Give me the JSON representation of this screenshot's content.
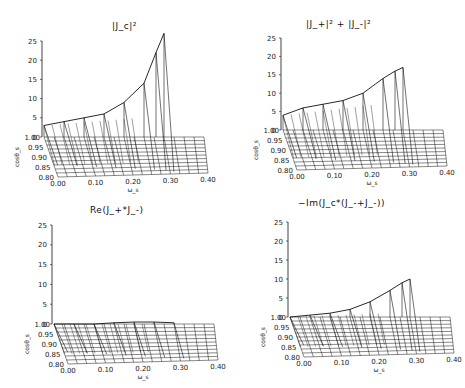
{
  "chart_data": [
    {
      "type": "surface3d",
      "title": "|J_c|²",
      "xlabel": "ω_s",
      "ylabel": "cosθ_s",
      "zlabel": "",
      "x_ticks": [
        "0.00",
        "0.10",
        "0.20",
        "0.30",
        "0.40"
      ],
      "y_ticks": [
        "0.80",
        "0.85",
        "0.90",
        "0.95",
        "1.00"
      ],
      "z_ticks": [
        "0",
        "5",
        "10",
        "15",
        "20",
        "25"
      ],
      "xlim": [
        0,
        0.4
      ],
      "ylim": [
        0.8,
        1.0
      ],
      "zlim": [
        0,
        25
      ],
      "x": [
        0.0,
        0.05,
        0.1,
        0.15,
        0.2,
        0.25,
        0.28,
        0.3
      ],
      "peak_at_cos1": [
        3,
        4,
        5,
        6,
        9,
        14,
        22,
        27
      ],
      "description": "Grows sharply with ω_s along cosθ_s=1 ridge, up to ~27 near ω_s≈0.30; near zero elsewhere"
    },
    {
      "type": "surface3d",
      "title": "|J_+|² + |J_-|²",
      "xlabel": "ω_s",
      "ylabel": "cosθ_s",
      "x_ticks": [
        "0.00",
        "0.10",
        "0.20",
        "0.30",
        "0.40"
      ],
      "y_ticks": [
        "0.80",
        "0.85",
        "0.90",
        "0.95",
        "1.00"
      ],
      "z_ticks": [
        "0",
        "5",
        "10",
        "15",
        "20",
        "25"
      ],
      "xlim": [
        0,
        0.4
      ],
      "ylim": [
        0.8,
        1.0
      ],
      "zlim": [
        0,
        25
      ],
      "x": [
        0.0,
        0.05,
        0.1,
        0.15,
        0.2,
        0.25,
        0.28,
        0.3
      ],
      "peak_at_cos1": [
        4,
        6,
        7,
        8,
        10,
        14,
        16,
        17
      ],
      "description": "Ridge at cosθ_s=1 rising to ~17 at ω_s≈0.30"
    },
    {
      "type": "surface3d",
      "title": "Re(J_+*J_-)",
      "xlabel": "ω_s",
      "ylabel": "cosθ_s",
      "x_ticks": [
        "0.00",
        "0.10",
        "0.20",
        "0.30",
        "0.40"
      ],
      "y_ticks": [
        "0.80",
        "0.85",
        "0.90",
        "0.95",
        "1.00"
      ],
      "z_ticks": [
        "0",
        "5",
        "10",
        "15",
        "20",
        "25"
      ],
      "xlim": [
        0,
        0.4
      ],
      "ylim": [
        0.8,
        1.0
      ],
      "zlim": [
        0,
        25
      ],
      "x": [
        0.0,
        0.05,
        0.1,
        0.15,
        0.2,
        0.25,
        0.3
      ],
      "peak_at_cos1": [
        0,
        0,
        0,
        0.3,
        0.5,
        0.5,
        0.3
      ],
      "description": "Nearly flat, small values near zero"
    },
    {
      "type": "surface3d",
      "title": "-Im(J_c*(J_-+J_-))",
      "xlabel": "ω_s",
      "ylabel": "cosθ_s",
      "x_ticks": [
        "0.00",
        "0.10",
        "0.20",
        "0.30",
        "0.40"
      ],
      "y_ticks": [
        "0.80",
        "0.85",
        "0.90",
        "0.95",
        "1.00"
      ],
      "z_ticks": [
        "0",
        "5",
        "10",
        "15",
        "20",
        "25"
      ],
      "xlim": [
        0,
        0.4
      ],
      "ylim": [
        0.8,
        1.0
      ],
      "zlim": [
        0,
        25
      ],
      "x": [
        0.0,
        0.05,
        0.1,
        0.15,
        0.2,
        0.25,
        0.28,
        0.3
      ],
      "peak_at_cos1": [
        0,
        0.5,
        1,
        2,
        4,
        7,
        9,
        10
      ],
      "description": "Rises with ω_s along cosθ_s=1 up to ~10"
    }
  ],
  "panels": [
    {
      "title": "|J_c|²"
    },
    {
      "title": "|J_+|²  +  |J_-|²"
    },
    {
      "title": "Re(J_+*J_-)"
    },
    {
      "title": "−Im(J_c*(J_-+J_-))"
    }
  ],
  "axes": {
    "x_label": "ω_s",
    "y_label": "cosθ_s",
    "x_ticks": [
      "0.00",
      "0.10",
      "0.20",
      "0.30",
      "0.40"
    ],
    "y_ticks": [
      "0.80",
      "0.85",
      "0.90",
      "0.95",
      "1.00"
    ],
    "z_ticks": [
      "0",
      "5",
      "10",
      "15",
      "20",
      "25"
    ]
  }
}
